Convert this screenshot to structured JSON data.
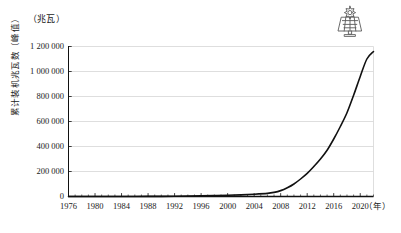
{
  "chart_data": {
    "type": "line",
    "title": "",
    "subtitle": "",
    "xlabel": "（年）",
    "ylabel": "累计装机兆瓦数（峰值）",
    "unit_caption": "（兆瓦）",
    "xlim": [
      1976,
      2022
    ],
    "ylim": [
      0,
      1200000
    ],
    "grid": true,
    "legend": false,
    "xtick_labels": [
      "1976",
      "1980",
      "1984",
      "1988",
      "1992",
      "1996",
      "2000",
      "2004",
      "2008",
      "2012",
      "2016",
      "2020"
    ],
    "xtick_values": [
      1976,
      1980,
      1984,
      1988,
      1992,
      1996,
      2000,
      2004,
      2008,
      2012,
      2016,
      2020
    ],
    "ytick_labels": [
      "0",
      "200 000",
      "400 000",
      "600 000",
      "800 000",
      "1 000 000",
      "1 200 000"
    ],
    "ytick_values": [
      0,
      200000,
      400000,
      600000,
      800000,
      1000000,
      1200000
    ],
    "minor_xtick_step": 1,
    "series": [
      {
        "name": "累计装机兆瓦数（峰值）",
        "color": "#111111",
        "x": [
          1976,
          1978,
          1980,
          1982,
          1984,
          1986,
          1988,
          1990,
          1992,
          1994,
          1996,
          1998,
          2000,
          2002,
          2004,
          2006,
          2007,
          2008,
          2009,
          2010,
          2011,
          2012,
          2013,
          2014,
          2015,
          2016,
          2017,
          2018,
          2019,
          2020,
          2021,
          2022
        ],
        "values": [
          0,
          0,
          20,
          60,
          150,
          350,
          700,
          1300,
          2200,
          3400,
          5000,
          7000,
          9500,
          13000,
          18000,
          25000,
          33000,
          47000,
          70000,
          100000,
          140000,
          185000,
          240000,
          300000,
          370000,
          460000,
          560000,
          670000,
          810000,
          960000,
          1100000,
          1160000
        ],
        "style": "solid",
        "width": 1.6
      }
    ],
    "annotations": []
  },
  "icons": {
    "solar_panel": "solar-panel-icon"
  },
  "colors": {
    "background": "#ffffff",
    "axis": "#111111",
    "grid": "#d6d6d6",
    "line": "#111111",
    "text": "#1a1a1a",
    "icon_stroke": "#5a5a5a"
  }
}
